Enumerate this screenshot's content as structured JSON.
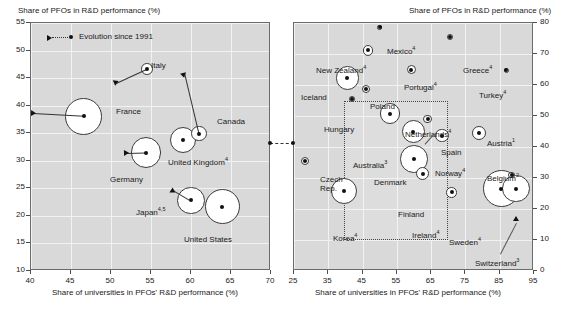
{
  "chart_data": [
    {
      "id": "left-panel",
      "type": "scatter",
      "title": "",
      "ylabel": "Share of PFOs in R&D performance (%)",
      "xlabel": "Share of universities in PFOs' R&D performance (%)",
      "xlim": [
        40,
        70
      ],
      "ylim": [
        10,
        55
      ],
      "xticks": [
        40,
        45,
        50,
        55,
        60,
        65,
        70
      ],
      "yticks": [
        10,
        15,
        20,
        25,
        30,
        35,
        40,
        45,
        50,
        55
      ],
      "grid": true,
      "legend": {
        "label": "Evolution since 1991",
        "position": "top-left"
      },
      "points": [
        {
          "name": "Italy",
          "x": 54.5,
          "y": 46.7,
          "size": 2.4,
          "x1991": 50.6,
          "y1991": 44.1
        },
        {
          "name": "France",
          "x": 46.6,
          "y": 38.1,
          "size": 7.5,
          "x1991": 40.2,
          "y1991": 38.6
        },
        {
          "name": "Canada",
          "x": 61.0,
          "y": 34.9,
          "size": 3.1,
          "x1991": 59.2,
          "y1991": 45.9
        },
        {
          "name": "United Kingdom",
          "x": 59.0,
          "y": 33.8,
          "size": 5.4,
          "footnote": "4"
        },
        {
          "name": "Germany",
          "x": 54.4,
          "y": 31.5,
          "size": 6.2,
          "x1991": 51.9,
          "y1991": 31.4
        },
        {
          "name": "Japan",
          "x": 60.0,
          "y": 22.8,
          "size": 5.6,
          "footnote": "4,5",
          "x1991": 57.8,
          "y1991": 24.7
        },
        {
          "name": "United States",
          "x": 63.9,
          "y": 21.7,
          "size": 7.2
        }
      ]
    },
    {
      "id": "right-panel",
      "type": "scatter",
      "title": "",
      "ylabel": "Share of PFOs in R&D performance (%)",
      "xlabel": "Share of universities in PFOs' R&D performance (%)",
      "xlim": [
        25,
        95
      ],
      "ylim": [
        0,
        80
      ],
      "xticks": [
        25,
        35,
        45,
        55,
        65,
        75,
        85,
        95
      ],
      "yticks": [
        0,
        10,
        20,
        30,
        40,
        50,
        60,
        70,
        80
      ],
      "grid": true,
      "highlight_box": {
        "x0": 39.5,
        "x1": 70.0,
        "y0": 10.0,
        "y1": 55.0
      },
      "points": [
        {
          "name": "Mexico",
          "x": 50.0,
          "y": 78.6,
          "size": 1.1,
          "footnote": "4"
        },
        {
          "name": "Greece",
          "x": 70.4,
          "y": 75.6,
          "size": 1.4,
          "footnote": "4"
        },
        {
          "name": "New Zealand",
          "x": 46.6,
          "y": 71.2,
          "size": 2.6,
          "footnote": "4"
        },
        {
          "name": "Portugal",
          "x": 59.2,
          "y": 64.9,
          "size": 2.2,
          "footnote": "4"
        },
        {
          "name": "Turkey",
          "x": 86.9,
          "y": 64.7,
          "size": 1.2,
          "footnote": "4"
        },
        {
          "name": "Iceland",
          "x": 40.6,
          "y": 62.3,
          "size": 5.7
        },
        {
          "name": "Poland",
          "x": 45.9,
          "y": 58.6,
          "size": 2.0
        },
        {
          "name": "Hungary",
          "x": 42.0,
          "y": 55.6,
          "size": 1.4
        },
        {
          "name": "Australia",
          "x": 53.0,
          "y": 50.8,
          "size": 5.0,
          "footnote": "3"
        },
        {
          "name": "Netherlands",
          "x": 64.0,
          "y": 49.0,
          "size": 2.1,
          "footnote": "4"
        },
        {
          "name": "Spain",
          "x": 59.8,
          "y": 45.0,
          "size": 5.6
        },
        {
          "name": "Austria",
          "x": 79.0,
          "y": 44.6,
          "size": 3.4,
          "footnote": "1"
        },
        {
          "name": "Norway",
          "x": 68.2,
          "y": 43.7,
          "size": 3.3,
          "footnote": "4"
        },
        {
          "name": "Denmark",
          "x": 60.0,
          "y": 36.1,
          "size": 6.7
        },
        {
          "name": "Czech Rep.",
          "x": 28.3,
          "y": 35.6,
          "size": 2.0
        },
        {
          "name": "Finland",
          "x": 62.6,
          "y": 31.4,
          "size": 3.2
        },
        {
          "name": "Belgium",
          "x": 88.5,
          "y": 31.0,
          "size": 1.6,
          "footnote": "2"
        },
        {
          "name": "Sweden",
          "x": 85.5,
          "y": 26.5,
          "size": 9.0,
          "footnote": "4"
        },
        {
          "name": "Switzerland",
          "x": 89.8,
          "y": 26.6,
          "size": 6.8,
          "footnote": "3"
        },
        {
          "name": "Korea",
          "x": 39.5,
          "y": 25.8,
          "size": 6.3,
          "footnote": "4"
        },
        {
          "name": "Ireland",
          "x": 71.0,
          "y": 25.4,
          "size": 2.6,
          "footnote": "4"
        }
      ]
    }
  ],
  "left": {
    "ylabel": "Share of PFOs in R&D performance (%)",
    "xlabel": "Share of universities in PFOs' R&D performance (%)",
    "legend_label": "Evolution since 1991",
    "yticks": [
      "55",
      "50",
      "45",
      "40",
      "35",
      "30",
      "25",
      "20",
      "15",
      "10"
    ],
    "xticks": [
      "40",
      "45",
      "50",
      "55",
      "60",
      "65",
      "70"
    ],
    "labels": {
      "italy": "Italy",
      "france": "France",
      "canada": "Canada",
      "united_kingdom": "United Kingdom",
      "united_kingdom_fn": "4",
      "germany": "Germany",
      "japan": "Japan",
      "japan_fn": "4,5",
      "united_states": "United States"
    }
  },
  "right": {
    "ylabel": "Share of PFOs in R&D performance (%)",
    "xlabel": "Share of universities in PFOs' R&D performance (%)",
    "yticks": [
      "80",
      "70",
      "60",
      "50",
      "40",
      "30",
      "20",
      "10",
      "0"
    ],
    "xticks": [
      "25",
      "35",
      "45",
      "55",
      "65",
      "75",
      "85",
      "95"
    ],
    "labels": {
      "mexico": "Mexico",
      "mexico_fn": "4",
      "greece": "Greece",
      "greece_fn": "4",
      "new_zealand": "New Zealand",
      "new_zealand_fn": "4",
      "portugal": "Portugal",
      "portugal_fn": "4",
      "turkey": "Turkey",
      "turkey_fn": "4",
      "iceland": "Iceland",
      "poland": "Poland",
      "hungary": "Hungary",
      "australia": "Australia",
      "australia_fn": "3",
      "netherlands": "Netherlands",
      "netherlands_fn": "4",
      "spain": "Spain",
      "austria": "Austria",
      "austria_fn": "1",
      "norway": "Norway",
      "norway_fn": "4",
      "denmark": "Denmark",
      "czech_rep": "Czech",
      "czech_rep2": "Rep.",
      "finland": "Finland",
      "belgium": "Belgium",
      "belgium_fn": "2",
      "sweden": "Sweden",
      "sweden_fn": "4",
      "switzerland": "Switzerland",
      "switzerland_fn": "3",
      "korea": "Korea",
      "korea_fn": "4",
      "ireland": "Ireland",
      "ireland_fn": "4"
    }
  }
}
